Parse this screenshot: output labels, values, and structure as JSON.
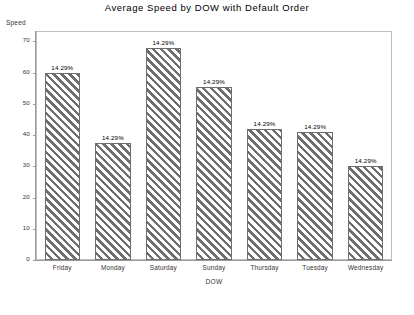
{
  "chart_data": {
    "type": "bar",
    "title": "Average Speed by DOW with Default Order",
    "xlabel": "DOW",
    "ylabel": "Speed",
    "categories": [
      "Friday",
      "Monday",
      "Saturday",
      "Sunday",
      "Thursday",
      "Tuesday",
      "Wednesday"
    ],
    "values": [
      60,
      37.5,
      68,
      55.5,
      42,
      41,
      30
    ],
    "data_labels": [
      "14.29%",
      "14.29%",
      "14.29%",
      "14.29%",
      "14.29%",
      "14.29%",
      "14.29%"
    ],
    "ylim": [
      0,
      73
    ],
    "yticks": [
      0,
      10,
      20,
      30,
      40,
      50,
      60,
      70
    ],
    "ytick_labels": [
      "0",
      "10",
      "20",
      "30",
      "40",
      "50",
      "60",
      "70"
    ],
    "grid": false,
    "legend": false,
    "bar_fill": "diagonal-hatch",
    "bar_color": "#6e6e6e",
    "frame_color": "#bdbdbd",
    "background": "#ffffff"
  }
}
